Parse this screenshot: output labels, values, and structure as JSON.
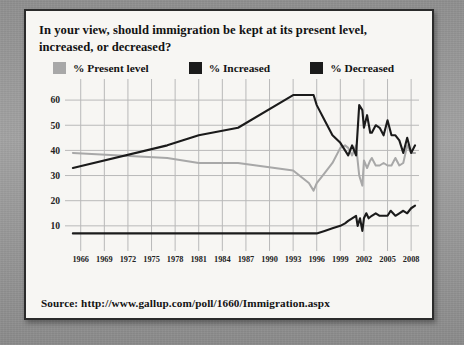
{
  "card": {
    "title": "In your view, should immigration be kept at its present level, increased, or decreased?",
    "source": "Source: http://www.gallup.com/poll/1660/Immigration.aspx"
  },
  "legend": {
    "items": [
      {
        "label": "% Present level",
        "color": "#a8a8a8"
      },
      {
        "label": "% Increased",
        "color": "#1b1b1b"
      },
      {
        "label": "% Decreased",
        "color": "#1b1b1b"
      }
    ]
  },
  "chart_data": {
    "type": "line",
    "title": "In your view, should immigration be kept at its present level, increased, or decreased?",
    "xlabel": "",
    "ylabel": "",
    "xlim": [
      1964,
      2009
    ],
    "ylim": [
      0,
      66
    ],
    "grid": true,
    "legend_position": "above-plot",
    "ytick_labels": [
      10,
      20,
      30,
      40,
      50,
      60
    ],
    "xtick_labels": [
      1966,
      1969,
      1972,
      1975,
      1978,
      1981,
      1984,
      1987,
      1990,
      1993,
      1996,
      1999,
      2002,
      2005,
      2008
    ],
    "series": [
      {
        "name": "% Present level",
        "color": "#a8a8a8",
        "points": [
          [
            1965,
            39
          ],
          [
            1977,
            37
          ],
          [
            1981,
            35
          ],
          [
            1986,
            35
          ],
          [
            1993,
            32
          ],
          [
            1995,
            27
          ],
          [
            1995.6,
            24
          ],
          [
            1996,
            27
          ],
          [
            1997,
            31
          ],
          [
            1998,
            35
          ],
          [
            1999,
            41
          ],
          [
            1999.6,
            42
          ],
          [
            2000,
            41
          ],
          [
            2000.5,
            38
          ],
          [
            2001,
            42
          ],
          [
            2001.4,
            30
          ],
          [
            2001.8,
            26
          ],
          [
            2002,
            36
          ],
          [
            2002.4,
            33
          ],
          [
            2002.8,
            36
          ],
          [
            2003,
            37
          ],
          [
            2003.5,
            34
          ],
          [
            2004,
            34
          ],
          [
            2004.5,
            35
          ],
          [
            2005,
            34
          ],
          [
            2005.5,
            34
          ],
          [
            2006,
            37
          ],
          [
            2006.5,
            34
          ],
          [
            2007,
            35
          ],
          [
            2007.5,
            42
          ],
          [
            2008,
            39
          ],
          [
            2008.5,
            39
          ]
        ]
      },
      {
        "name": "% Increased",
        "color": "#1b1b1b",
        "points": [
          [
            1965,
            7
          ],
          [
            1977,
            7
          ],
          [
            1981,
            7
          ],
          [
            1986,
            7
          ],
          [
            1993,
            7
          ],
          [
            1995,
            7
          ],
          [
            1996,
            7
          ],
          [
            1997,
            8
          ],
          [
            1998,
            9
          ],
          [
            1999,
            10
          ],
          [
            1999.6,
            11
          ],
          [
            2000,
            12
          ],
          [
            2000.5,
            13
          ],
          [
            2001,
            14
          ],
          [
            2001.2,
            10
          ],
          [
            2001.5,
            13
          ],
          [
            2001.8,
            8
          ],
          [
            2002,
            13
          ],
          [
            2002.3,
            15
          ],
          [
            2002.6,
            13
          ],
          [
            2003,
            14
          ],
          [
            2003.5,
            15
          ],
          [
            2004,
            14
          ],
          [
            2004.5,
            14
          ],
          [
            2005,
            14
          ],
          [
            2005.4,
            16
          ],
          [
            2006,
            14
          ],
          [
            2006.5,
            15
          ],
          [
            2007,
            16
          ],
          [
            2007.5,
            15
          ],
          [
            2008,
            17
          ],
          [
            2008.5,
            18
          ]
        ]
      },
      {
        "name": "% Decreased",
        "color": "#1b1b1b",
        "points": [
          [
            1965,
            33
          ],
          [
            1977,
            42
          ],
          [
            1981,
            46
          ],
          [
            1986,
            49
          ],
          [
            1993,
            62
          ],
          [
            1995,
            62
          ],
          [
            1995.6,
            62
          ],
          [
            1996,
            58
          ],
          [
            1997,
            52
          ],
          [
            1998,
            46
          ],
          [
            1999,
            43
          ],
          [
            1999.6,
            40
          ],
          [
            2000,
            38
          ],
          [
            2000.5,
            42
          ],
          [
            2001,
            38
          ],
          [
            2001.4,
            58
          ],
          [
            2001.8,
            56
          ],
          [
            2002,
            49
          ],
          [
            2002.4,
            54
          ],
          [
            2002.8,
            47
          ],
          [
            2003,
            47
          ],
          [
            2003.5,
            50
          ],
          [
            2004,
            49
          ],
          [
            2004.5,
            46
          ],
          [
            2005,
            52
          ],
          [
            2005.5,
            46
          ],
          [
            2006,
            46
          ],
          [
            2006.5,
            44
          ],
          [
            2007,
            39
          ],
          [
            2007.5,
            45
          ],
          [
            2008,
            39
          ],
          [
            2008.5,
            42
          ]
        ]
      }
    ]
  }
}
